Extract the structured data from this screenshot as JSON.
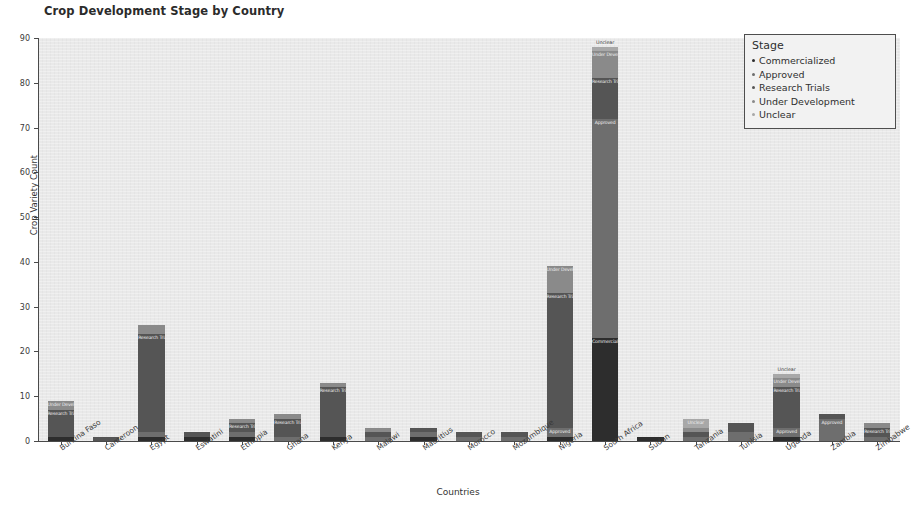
{
  "chart_data": {
    "type": "bar",
    "subtype": "stacked-bar",
    "title": "Crop Development Stage by Country",
    "xlabel": "Countries",
    "ylabel": "Crop Variety Count",
    "ylim": [
      0,
      90
    ],
    "yticks": [
      0,
      10,
      20,
      30,
      40,
      50,
      60,
      70,
      80,
      90
    ],
    "grid": false,
    "legend": {
      "title": "Stage",
      "position": "upper right",
      "entries": [
        "Commercialized",
        "Approved",
        "Research Trials",
        "Under Development",
        "Unclear"
      ]
    },
    "series_order": [
      "Commercialized",
      "Approved",
      "Research Trials",
      "Under Development",
      "Unclear"
    ],
    "colors": {
      "Commercialized": "#2d2d2d",
      "Approved": "#6e6e6e",
      "Research Trials": "#555555",
      "Under Development": "#8a8a8a",
      "Unclear": "#a8a8a8"
    },
    "categories": [
      "Burkina Faso",
      "Cameroon",
      "Egypt",
      "Eswatini",
      "Ethiopia",
      "Ghana",
      "Kenya",
      "Malawi",
      "Mauritius",
      "Morocco",
      "Mozambique",
      "Nigeria",
      "South Africa",
      "Sudan",
      "Tanzania",
      "Tunisia",
      "Uganda",
      "Zambia",
      "Zimbabwe"
    ],
    "series": [
      {
        "name": "Commercialized",
        "values": [
          1,
          0,
          1,
          1,
          1,
          0,
          1,
          0,
          1,
          0,
          0,
          1,
          23,
          1,
          0,
          0,
          1,
          0,
          0
        ]
      },
      {
        "name": "Approved",
        "values": [
          0,
          0,
          1,
          0,
          1,
          1,
          0,
          1,
          1,
          1,
          1,
          2,
          49,
          0,
          1,
          2,
          2,
          5,
          1
        ]
      },
      {
        "name": "Research Trials",
        "values": [
          6,
          1,
          22,
          1,
          2,
          4,
          11,
          1,
          1,
          1,
          1,
          30,
          9,
          0,
          1,
          2,
          9,
          1,
          2
        ]
      },
      {
        "name": "Under Development",
        "values": [
          2,
          0,
          2,
          0,
          1,
          1,
          1,
          1,
          0,
          0,
          0,
          6,
          6,
          0,
          1,
          0,
          2,
          0,
          1
        ]
      },
      {
        "name": "Unclear",
        "values": [
          0,
          0,
          0,
          0,
          0,
          0,
          0,
          0,
          0,
          0,
          0,
          0,
          1,
          0,
          2,
          0,
          1,
          0,
          0
        ]
      }
    ],
    "totals": [
      9,
      1,
      26,
      2,
      5,
      6,
      13,
      3,
      3,
      2,
      2,
      39,
      88,
      1,
      5,
      4,
      15,
      6,
      4
    ],
    "annotations": [
      {
        "category": "Burkina Faso",
        "text": "Under Development"
      },
      {
        "category": "Burkina Faso",
        "text": "Research Trials"
      },
      {
        "category": "Burkina Faso",
        "text": "Commercialized"
      },
      {
        "category": "Cameroon",
        "text": "Research Trials"
      },
      {
        "category": "Egypt",
        "text": "Research Trials"
      },
      {
        "category": "Eswatini",
        "text": "Commercialized"
      },
      {
        "category": "Ethiopia",
        "text": "Research Trials"
      },
      {
        "category": "Ethiopia",
        "text": "Commercialized"
      },
      {
        "category": "Ghana",
        "text": "Research Trials"
      },
      {
        "category": "Kenya",
        "text": "Research Trials"
      },
      {
        "category": "Malawi",
        "text": "Approved"
      },
      {
        "category": "Mauritius",
        "text": "Commercialized"
      },
      {
        "category": "Nigeria",
        "text": "Under Development"
      },
      {
        "category": "Nigeria",
        "text": "Research Trials"
      },
      {
        "category": "Nigeria",
        "text": "Approved"
      },
      {
        "category": "Nigeria",
        "text": "Commercialized"
      },
      {
        "category": "South Africa",
        "text": "Unclear"
      },
      {
        "category": "South Africa",
        "text": "Under Development"
      },
      {
        "category": "South Africa",
        "text": "Research Trials"
      },
      {
        "category": "South Africa",
        "text": "Approved"
      },
      {
        "category": "South Africa",
        "text": "Commercialized"
      },
      {
        "category": "Sudan",
        "text": "Commercialized"
      },
      {
        "category": "Tanzania",
        "text": "Unclear"
      },
      {
        "category": "Uganda",
        "text": "Under Development"
      },
      {
        "category": "Uganda",
        "text": "Research Trials"
      },
      {
        "category": "Uganda",
        "text": "Approved"
      },
      {
        "category": "Zambia",
        "text": "Approved"
      },
      {
        "category": "Zimbabwe",
        "text": "Under Development"
      },
      {
        "category": "Zimbabwe",
        "text": "Research Trials"
      }
    ]
  }
}
